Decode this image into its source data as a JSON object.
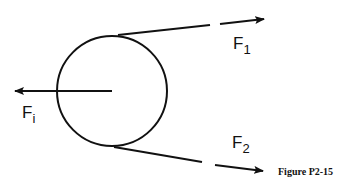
{
  "figure": {
    "caption": "Figure P2-15",
    "forces": {
      "fi": {
        "main": "F",
        "sub": "i"
      },
      "f1": {
        "main": "F",
        "sub": "1"
      },
      "f2": {
        "main": "F",
        "sub": "2"
      }
    },
    "colors": {
      "stroke": "#111111",
      "background": "#ffffff"
    }
  }
}
